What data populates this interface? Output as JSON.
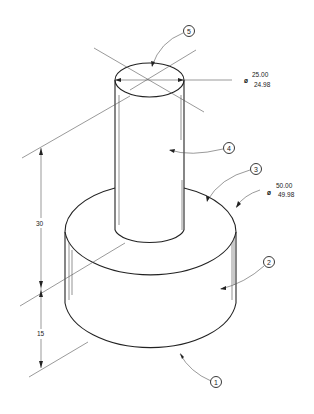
{
  "drawing": {
    "type": "isometric technical drawing",
    "subject": "stepped cylindrical shaft"
  },
  "dimensions": {
    "small_diameter": {
      "symbol": "ø",
      "upper": "25.00",
      "lower": "24.98"
    },
    "large_diameter": {
      "symbol": "ø",
      "upper": "50.00",
      "lower": "49.98"
    },
    "height_upper": "30",
    "height_lower": "15"
  },
  "balloons": [
    {
      "id": "1",
      "label": "1"
    },
    {
      "id": "2",
      "label": "2"
    },
    {
      "id": "3",
      "label": "3"
    },
    {
      "id": "4",
      "label": "4"
    },
    {
      "id": "5",
      "label": "5"
    }
  ]
}
